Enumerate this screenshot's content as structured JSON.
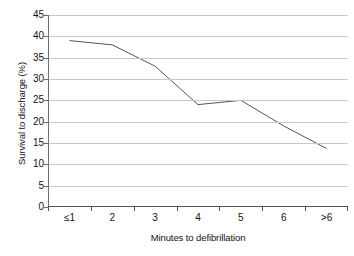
{
  "chart_data": {
    "type": "line",
    "title": "",
    "xlabel": "Minutes to defibrillation",
    "ylabel": "Survival to discharge (%)",
    "categories": [
      "≤1",
      "2",
      "3",
      "4",
      "5",
      "6",
      ">6"
    ],
    "values": [
      39,
      38,
      33,
      24,
      25,
      19,
      13.7
    ],
    "series": [
      {
        "name": "Survival to discharge",
        "values": [
          39,
          38,
          33,
          24,
          25,
          19,
          13.7
        ]
      }
    ],
    "ylim": [
      0,
      45
    ],
    "yticks": [
      0,
      5,
      10,
      15,
      20,
      25,
      30,
      35,
      40,
      45
    ],
    "ytick_labels": [
      "0",
      "5",
      "10",
      "15",
      "20",
      "25",
      "30",
      "35",
      "40",
      "45"
    ],
    "grid": "horizontal",
    "legend": "none",
    "markers": "none",
    "line_color": "#555555",
    "gridline_color": "#c8c8c8",
    "axis_color": "#555555",
    "background_color": "#ffffff"
  }
}
